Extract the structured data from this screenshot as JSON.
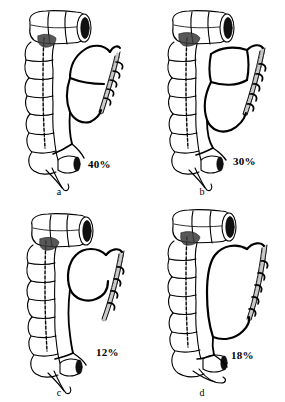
{
  "figure": {
    "type": "medical-anatomical-illustration",
    "background_color": "#ffffff",
    "ink_color": "#000000",
    "panel_count": 4,
    "panels": [
      {
        "id": "a",
        "caption": "a",
        "percentage": "40%",
        "position": "top-left",
        "arcade_variant": "two-tier arcade with upper loop and lower loop joined by transverse branch"
      },
      {
        "id": "b",
        "caption": "b",
        "percentage": "30%",
        "position": "top-right",
        "arcade_variant": "squared upper arcade with separate lower arcade loop"
      },
      {
        "id": "c",
        "caption": "c",
        "percentage": "12%",
        "position": "bottom-left",
        "arcade_variant": "single rounded upper arcade with long descending branch"
      },
      {
        "id": "d",
        "caption": "d",
        "percentage": "18%",
        "position": "bottom-right",
        "arcade_variant": "single tall elongated arcade loop without cross branch"
      }
    ],
    "anatomy_labels": [
      "transverse-colon-cut-end",
      "descending-colon-haustra",
      "sigmoid-colon",
      "rectum-cut-end",
      "inferior-mesenteric-artery-trunk",
      "marginal-artery-arcade",
      "vasa-recta-branches"
    ]
  }
}
